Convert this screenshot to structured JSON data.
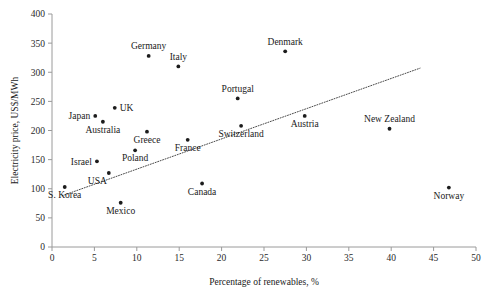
{
  "chart_data": {
    "type": "scatter",
    "title": "",
    "xlabel": "Percentage of renewables, %",
    "ylabel": "Electricity price, US$/MWh",
    "xlim": [
      0,
      50
    ],
    "ylim": [
      0,
      400
    ],
    "xticks": [
      0,
      5,
      10,
      15,
      20,
      25,
      30,
      35,
      40,
      45,
      50
    ],
    "yticks": [
      0,
      50,
      100,
      150,
      200,
      250,
      300,
      350,
      400
    ],
    "grid": false,
    "legend": "none",
    "marker_color": "#1c1c1c",
    "trendline": {
      "style": "dotted",
      "color": "#4a4a4a",
      "x_start": 1.2,
      "y_start": 88,
      "x_end": 43.4,
      "y_end": 307
    },
    "points": [
      {
        "label": "S. Korea",
        "x": 1.5,
        "y": 103,
        "label_pos": "below"
      },
      {
        "label": "Israel",
        "x": 5.3,
        "y": 147,
        "label_pos": "left"
      },
      {
        "label": "Japan",
        "x": 5.1,
        "y": 225,
        "label_pos": "left"
      },
      {
        "label": "Australia",
        "x": 6.0,
        "y": 215,
        "label_pos": "below"
      },
      {
        "label": "UK",
        "x": 7.4,
        "y": 239,
        "label_pos": "right"
      },
      {
        "label": "USA",
        "x": 6.7,
        "y": 127,
        "label_pos": "below-left"
      },
      {
        "label": "Mexico",
        "x": 8.1,
        "y": 76,
        "label_pos": "below"
      },
      {
        "label": "Poland",
        "x": 9.8,
        "y": 166,
        "label_pos": "below"
      },
      {
        "label": "Greece",
        "x": 11.2,
        "y": 198,
        "label_pos": "below"
      },
      {
        "label": "Germany",
        "x": 11.4,
        "y": 328,
        "label_pos": "above"
      },
      {
        "label": "Italy",
        "x": 14.9,
        "y": 310,
        "label_pos": "above"
      },
      {
        "label": "France",
        "x": 16.0,
        "y": 184,
        "label_pos": "below"
      },
      {
        "label": "Canada",
        "x": 17.7,
        "y": 109,
        "label_pos": "below"
      },
      {
        "label": "Portugal",
        "x": 21.9,
        "y": 255,
        "label_pos": "above"
      },
      {
        "label": "Switzerland",
        "x": 22.3,
        "y": 208,
        "label_pos": "below"
      },
      {
        "label": "Denmark",
        "x": 27.5,
        "y": 336,
        "label_pos": "above"
      },
      {
        "label": "Austria",
        "x": 29.8,
        "y": 225,
        "label_pos": "below"
      },
      {
        "label": "New Zealand",
        "x": 39.8,
        "y": 203,
        "label_pos": "above"
      },
      {
        "label": "Norway",
        "x": 46.8,
        "y": 102,
        "label_pos": "below"
      }
    ]
  }
}
